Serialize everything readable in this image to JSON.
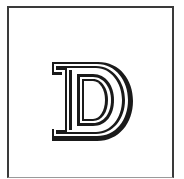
{
  "image": {
    "letter": "D",
    "style": "outlined slab-serif capital with drop shadow",
    "colors": {
      "background": "#ffffff",
      "ink": "#1a1a1a",
      "frame": "#3a3a3a"
    }
  }
}
